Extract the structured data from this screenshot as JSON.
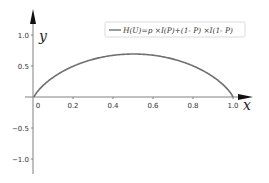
{
  "chart_data": {
    "type": "line",
    "title": "",
    "xlabel": "x",
    "ylabel": "y",
    "xlim": [
      0,
      1.0
    ],
    "ylim": [
      -1.2,
      1.2
    ],
    "x_ticks": [
      "0",
      "0.2",
      "0.4",
      "0.6",
      "0.8",
      "1.0"
    ],
    "y_ticks": [
      "1.0",
      "0.5",
      "-0.5",
      "-1.0"
    ],
    "grid": false,
    "legend_position": "upper right",
    "series": [
      {
        "name": "H(U)=p ×I(P)+(1- P) ×I(1- P)",
        "color": "#707070",
        "x": [
          0.0,
          0.05,
          0.1,
          0.2,
          0.3,
          0.4,
          0.5,
          0.6,
          0.7,
          0.8,
          0.9,
          0.95,
          1.0
        ],
        "values": [
          0.0,
          0.199,
          0.325,
          0.5,
          0.611,
          0.673,
          0.693,
          0.673,
          0.611,
          0.5,
          0.325,
          0.199,
          0.0
        ]
      }
    ]
  },
  "legend": {
    "label": "H(U)=p ×I(P)+(1- P) ×I(1- P)"
  },
  "axes": {
    "x_title": "x",
    "y_title": "y",
    "x_tick_labels": [
      "0",
      "0.2",
      "0.4",
      "0.6",
      "0.8",
      "1.0"
    ],
    "y_tick_labels": [
      "1.0",
      "0.5",
      "−0.5",
      "−1.0"
    ]
  }
}
